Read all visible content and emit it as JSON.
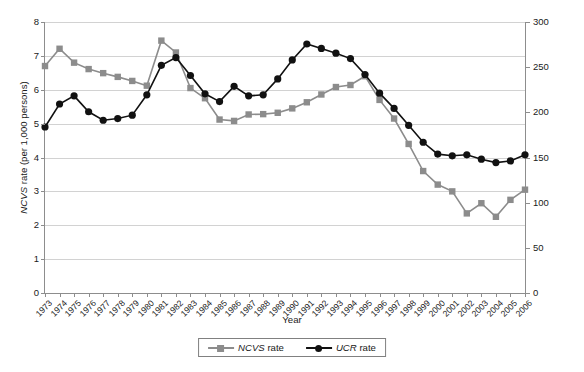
{
  "chart_data": {
    "type": "line",
    "title": "",
    "xlabel": "Year",
    "ylabel": "NCVS rate  (per 1,000 persons)",
    "y2label": "UCR rate  (per 100,000 inhabitants)",
    "grid": true,
    "legend_position": "bottom",
    "ylim": [
      0,
      8
    ],
    "y2lim": [
      0,
      300
    ],
    "yticks": [
      "0",
      "1",
      "2",
      "3",
      "4",
      "5",
      "6",
      "7",
      "8"
    ],
    "y2ticks": [
      "0",
      "50",
      "100",
      "150",
      "200",
      "250",
      "300"
    ],
    "categories": [
      "1973",
      "1974",
      "1975",
      "1976",
      "1977",
      "1978",
      "1979",
      "1980",
      "1981",
      "1982",
      "1983",
      "1984",
      "1985",
      "1986",
      "1987",
      "1988",
      "1989",
      "1990",
      "1991",
      "1992",
      "1993",
      "1994",
      "1995",
      "1996",
      "1997",
      "1998",
      "1999",
      "2000",
      "2001",
      "2002",
      "2003",
      "2004",
      "2005",
      "2006"
    ],
    "series": [
      {
        "name": "NCVS rate",
        "axis": "left",
        "units": "per 1,000 persons",
        "color": "#8c8c8c",
        "marker": "square",
        "values": [
          6.7,
          7.21,
          6.8,
          6.61,
          6.49,
          6.38,
          6.26,
          6.12,
          7.45,
          7.1,
          6.05,
          5.75,
          5.12,
          5.08,
          5.27,
          5.28,
          5.32,
          5.45,
          5.63,
          5.86,
          6.08,
          6.14,
          6.4,
          5.7,
          5.15,
          4.4,
          3.6,
          3.2,
          3.0,
          2.35,
          2.65,
          2.25,
          2.75,
          3.05
        ]
      },
      {
        "name": "UCR rate",
        "axis": "right",
        "units": "per 100,000 inhabitants",
        "color": "#111111",
        "marker": "circle",
        "values_left_scale": [
          4.9,
          5.58,
          5.82,
          5.35,
          5.1,
          5.15,
          5.25,
          5.85,
          6.72,
          6.95,
          6.42,
          5.88,
          5.65,
          6.1,
          5.82,
          5.85,
          6.32,
          6.88,
          7.35,
          7.22,
          7.08,
          6.92,
          6.45,
          5.9,
          5.45,
          4.95,
          4.45,
          4.1,
          4.05,
          4.08,
          3.95,
          3.85,
          3.9,
          4.08
        ],
        "values": [
          183.8,
          209.3,
          218.3,
          200.6,
          191.3,
          193.1,
          196.9,
          219.4,
          252.0,
          260.6,
          240.8,
          220.5,
          212.0,
          228.8,
          218.3,
          219.4,
          237.0,
          258.0,
          275.6,
          270.8,
          265.5,
          259.5,
          241.9,
          221.3,
          204.4,
          185.6,
          166.9,
          153.8,
          151.9,
          153.0,
          148.1,
          144.4,
          146.3,
          153.0
        ]
      }
    ]
  },
  "legend": {
    "items": [
      {
        "label_italic": "NCVS",
        "label_plain": " rate"
      },
      {
        "label_italic": "UCR",
        "label_plain": " rate"
      }
    ]
  }
}
